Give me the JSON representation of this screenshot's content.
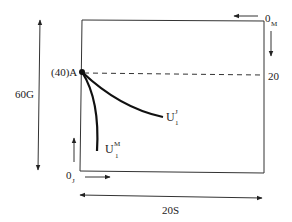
{
  "diagram": {
    "type": "Edgeworth box",
    "point_a": {
      "label": "(40)A"
    },
    "left_axis_label": "60G",
    "bottom_axis_label": "20S",
    "right_tick_label": "20",
    "origin_j": {
      "main": "0",
      "sub": "J"
    },
    "origin_m": {
      "main": "0",
      "sub": "M"
    },
    "curves": [
      {
        "name": "U1J",
        "main": "U",
        "sup": "J",
        "sub": "1"
      },
      {
        "name": "U1M",
        "main": "U",
        "sup": "M",
        "sub": "1"
      }
    ],
    "colors": {
      "ink": "#111111",
      "line": "#333333"
    }
  }
}
